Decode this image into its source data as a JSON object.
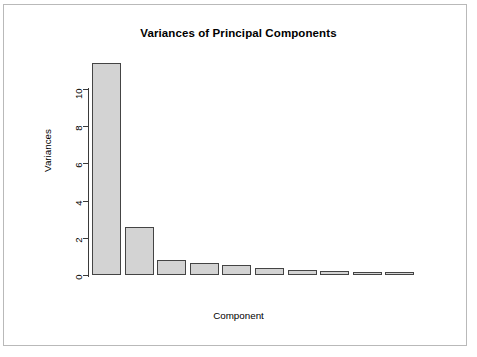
{
  "figure": {
    "title": "Variances of Principal Components",
    "x_axis_label": "Component",
    "y_axis_label": "Variances",
    "bar_fill_color": "#d3d3d3",
    "bar_border_color": "#444444",
    "axis_color": "#3a3a3a",
    "background_color": "#ffffff",
    "frame_color": "#b9b9b9"
  },
  "chart_data": {
    "type": "bar",
    "title": "Variances of Principal Components",
    "xlabel": "Component",
    "ylabel": "Variances",
    "categories": [
      "1",
      "2",
      "3",
      "4",
      "5",
      "6",
      "7",
      "8",
      "9",
      "10"
    ],
    "values": [
      11.4,
      2.6,
      0.78,
      0.62,
      0.53,
      0.37,
      0.26,
      0.21,
      0.18,
      0.13
    ],
    "ylim": [
      0,
      11.8
    ],
    "ytick_labels": [
      "0",
      "2",
      "4",
      "6",
      "8",
      "10"
    ],
    "ytick_values": [
      0,
      2,
      4,
      6,
      8,
      10
    ],
    "grid": false,
    "legend": false,
    "xtick_labels": []
  }
}
